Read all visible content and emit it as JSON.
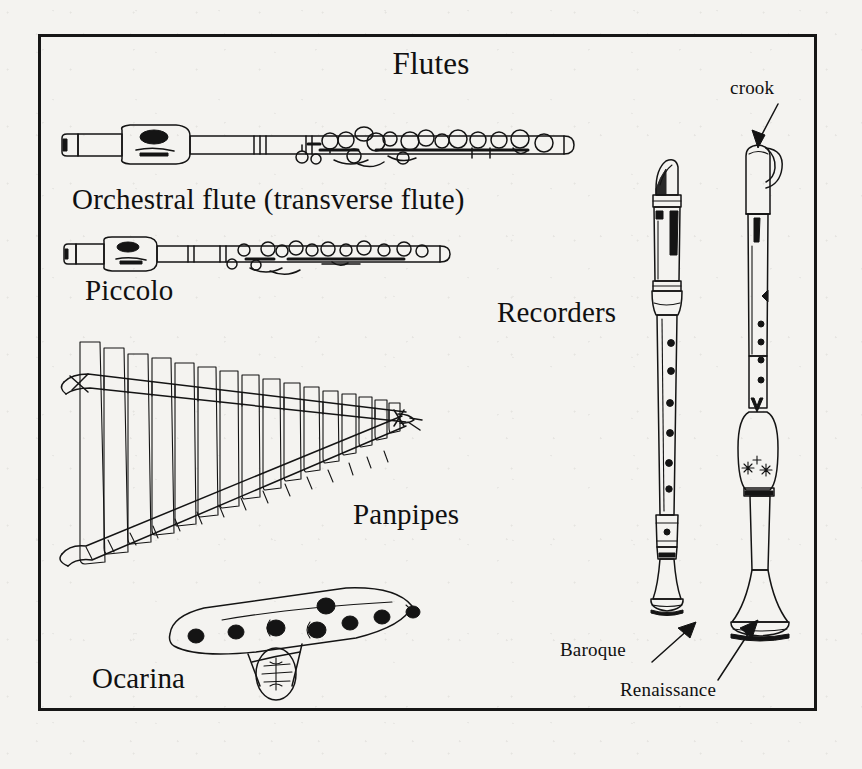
{
  "plate": {
    "title": "Flutes",
    "background_color": "#f4f3f0",
    "ink_color": "#141414",
    "border_color": "#161616"
  },
  "labels": {
    "orchestral_flute": "Orchestral flute (transverse flute)",
    "piccolo": "Piccolo",
    "recorders": "Recorders",
    "panpipes": "Panpipes",
    "ocarina": "Ocarina",
    "crook": "crook",
    "baroque": "Baroque",
    "renaissance": "Renaissance"
  },
  "instruments": [
    {
      "name": "Orchestral flute (transverse flute)",
      "type": "transverse-flute",
      "orientation": "horizontal",
      "features": [
        "headjoint",
        "embouchure-hole",
        "body-joint",
        "key-mechanism",
        "foot-joint"
      ],
      "key_cups": 14
    },
    {
      "name": "Piccolo",
      "type": "transverse-flute",
      "orientation": "horizontal",
      "features": [
        "headjoint",
        "embouchure-hole",
        "body-joint",
        "key-mechanism"
      ],
      "key_cups": 11
    },
    {
      "name": "Panpipes",
      "type": "raft-pipes",
      "orientation": "horizontal",
      "features": [
        "graduated-tubes",
        "binding-cords"
      ],
      "tube_count": 19
    },
    {
      "name": "Ocarina",
      "type": "vessel-flute",
      "orientation": "horizontal",
      "features": [
        "finger-holes",
        "mouthpiece",
        "windway"
      ],
      "finger_holes": 8
    },
    {
      "name": "Baroque",
      "type": "recorder",
      "orientation": "vertical",
      "features": [
        "beak-mouthpiece",
        "window-labium",
        "turned-rings",
        "finger-holes",
        "foot-joint",
        "flared-bell"
      ],
      "finger_holes": 7
    },
    {
      "name": "Renaissance",
      "type": "recorder",
      "orientation": "vertical",
      "features": [
        "crook",
        "cap",
        "window-labium",
        "finger-holes",
        "decorated-barrel",
        "flared-bell"
      ],
      "finger_holes": 6
    }
  ],
  "annotations": [
    {
      "text": "crook",
      "points_to": "Renaissance recorder crook",
      "arrow": "down-left"
    },
    {
      "text": "Baroque",
      "points_to": "Baroque recorder bell",
      "arrow": "up-right"
    },
    {
      "text": "Renaissance",
      "points_to": "Renaissance recorder bell",
      "arrow": "up-right"
    }
  ]
}
